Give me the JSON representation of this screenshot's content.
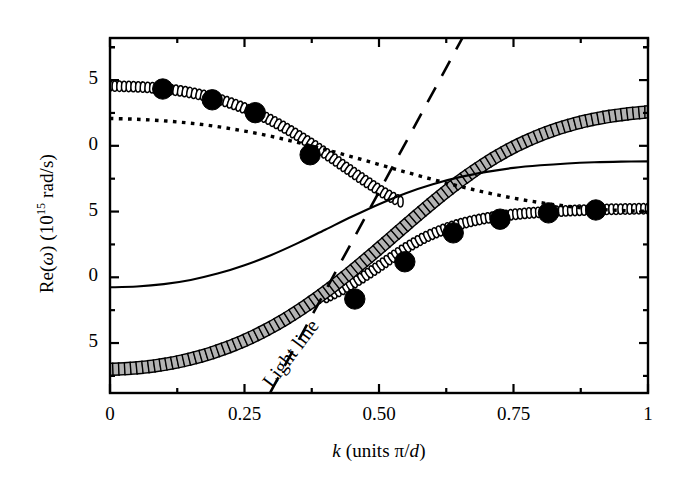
{
  "figure": {
    "kind": "dispersion-plot",
    "background": "#ffffff",
    "ink": "#000000",
    "square_fill": "#b3b3b3"
  },
  "axes": {
    "y_title_parts": {
      "pre": "Re(",
      "omega": "ω",
      "mid": ") (10",
      "exp": "15",
      "post": " rad/s)"
    },
    "y_title_plain": "Re(ω) (10¹⁵ rad/s)",
    "x_title_parts": {
      "k": "k",
      "rest": " (units ",
      "pi": "π",
      "slash": "/",
      "d": "d",
      "close": ")"
    },
    "x_title_plain": "k (units π/d)",
    "x_ticks": [
      {
        "value": 0,
        "label": "0"
      },
      {
        "value": 0.25,
        "label": "0.25"
      },
      {
        "value": 0.5,
        "label": "0.50"
      },
      {
        "value": 0.75,
        "label": "0.75"
      },
      {
        "value": 1,
        "label": "1"
      }
    ],
    "x_minor_count": 1,
    "x_range": [
      0,
      1
    ],
    "y_ticks": [
      {
        "value": 2.5,
        "label": "5"
      },
      {
        "value": 2.0,
        "label": "0"
      },
      {
        "value": 1.5,
        "label": "5"
      },
      {
        "value": 1.0,
        "label": "0"
      },
      {
        "value": 0.5,
        "label": "5"
      }
    ],
    "y_minor_count": 1,
    "y_range": [
      0.12,
      2.82
    ],
    "frame": {
      "left": 110,
      "right": 648,
      "top": 38,
      "bottom": 393
    }
  },
  "annotations": [
    {
      "name": "light-line-label",
      "text": "Light line",
      "x": 0.355,
      "y": 0.4,
      "rotation": -53
    }
  ],
  "chart_data": {
    "type": "line",
    "title": "",
    "xlabel": "k (units π/d)",
    "ylabel": "Re(ω) (10¹⁵ rad/s)",
    "xlim": [
      0,
      1
    ],
    "ylim": [
      0.12,
      2.82
    ],
    "grid": false,
    "legend": "none",
    "series": [
      {
        "name": "upper-branch-open-circles",
        "style": "open-circle-chain",
        "marker": "open-circle",
        "x": [
          0.0,
          0.03,
          0.06,
          0.09,
          0.12,
          0.15,
          0.18,
          0.21,
          0.24,
          0.27,
          0.3,
          0.33,
          0.36,
          0.39,
          0.42,
          0.45,
          0.48,
          0.51,
          0.54
        ],
        "y": [
          2.455,
          2.452,
          2.447,
          2.438,
          2.424,
          2.404,
          2.378,
          2.344,
          2.302,
          2.252,
          2.193,
          2.126,
          2.052,
          1.972,
          1.888,
          1.802,
          1.718,
          1.64,
          1.575
        ]
      },
      {
        "name": "lower-branch-open-circles",
        "style": "open-circle-chain",
        "marker": "open-circle",
        "x": [
          0.4,
          0.43,
          0.46,
          0.49,
          0.52,
          0.55,
          0.58,
          0.61,
          0.64,
          0.67,
          0.7,
          0.73,
          0.76,
          0.79,
          0.82,
          0.85,
          0.88,
          0.91,
          0.94,
          0.97,
          1.0
        ],
        "y": [
          0.845,
          0.905,
          0.975,
          1.055,
          1.14,
          1.222,
          1.292,
          1.348,
          1.392,
          1.425,
          1.45,
          1.468,
          1.482,
          1.492,
          1.5,
          1.506,
          1.511,
          1.515,
          1.518,
          1.52,
          1.522
        ]
      },
      {
        "name": "square-branch",
        "style": "square-chain",
        "marker": "square",
        "x": [
          0.0,
          0.04,
          0.08,
          0.12,
          0.16,
          0.2,
          0.24,
          0.28,
          0.32,
          0.36,
          0.4,
          0.44,
          0.48,
          0.52,
          0.56,
          0.6,
          0.64,
          0.68,
          0.72,
          0.76,
          0.8,
          0.84,
          0.88,
          0.92,
          0.96,
          1.0
        ],
        "y": [
          0.3,
          0.308,
          0.325,
          0.352,
          0.39,
          0.44,
          0.502,
          0.578,
          0.668,
          0.772,
          0.888,
          1.015,
          1.15,
          1.29,
          1.432,
          1.57,
          1.7,
          1.818,
          1.922,
          2.01,
          2.082,
          2.14,
          2.185,
          2.218,
          2.242,
          2.258
        ]
      },
      {
        "name": "solid-curve",
        "style": "solid",
        "x": [
          0.0,
          0.05,
          0.1,
          0.15,
          0.2,
          0.25,
          0.3,
          0.35,
          0.4,
          0.45,
          0.5,
          0.55,
          0.6,
          0.65,
          0.7,
          0.75,
          0.8,
          0.85,
          0.9,
          0.95,
          1.0
        ],
        "y": [
          0.924,
          0.93,
          0.948,
          0.98,
          1.028,
          1.092,
          1.17,
          1.262,
          1.362,
          1.462,
          1.556,
          1.64,
          1.708,
          1.762,
          1.802,
          1.832,
          1.852,
          1.866,
          1.875,
          1.88,
          1.882
        ]
      },
      {
        "name": "dotted-curve",
        "style": "dotted",
        "x": [
          0.0,
          0.05,
          0.1,
          0.15,
          0.2,
          0.25,
          0.3,
          0.35,
          0.4,
          0.45,
          0.5,
          0.55,
          0.6,
          0.65,
          0.7,
          0.75,
          0.8,
          0.85,
          0.9,
          0.95,
          1.0
        ],
        "y": [
          2.208,
          2.202,
          2.19,
          2.172,
          2.146,
          2.112,
          2.072,
          2.024,
          1.972,
          1.916,
          1.858,
          1.8,
          1.744,
          1.692,
          1.644,
          1.602,
          1.568,
          1.54,
          1.52,
          1.508,
          1.502
        ]
      },
      {
        "name": "light-line-dashed",
        "style": "dashed",
        "x": [
          0.298,
          0.655
        ],
        "y": [
          0.125,
          2.82
        ]
      },
      {
        "name": "filled-circle-markers-upper",
        "style": "markers",
        "marker": "filled-circle",
        "x": [
          0.098,
          0.19,
          0.27,
          0.372
        ],
        "y": [
          2.432,
          2.35,
          2.252,
          1.932
        ]
      },
      {
        "name": "filled-circle-markers-lower",
        "style": "markers",
        "marker": "filled-circle",
        "x": [
          0.455,
          0.548,
          0.638,
          0.725,
          0.815,
          0.903
        ],
        "y": [
          0.835,
          1.118,
          1.338,
          1.442,
          1.49,
          1.512
        ]
      }
    ]
  }
}
